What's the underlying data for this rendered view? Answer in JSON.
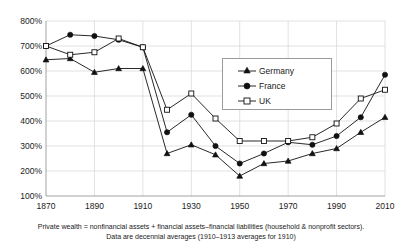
{
  "chart_data": {
    "type": "line",
    "title": "",
    "xlabel": "",
    "ylabel": "",
    "x": [
      1870,
      1880,
      1890,
      1900,
      1910,
      1920,
      1930,
      1940,
      1950,
      1960,
      1970,
      1980,
      1990,
      2000,
      2010
    ],
    "xlim": [
      1870,
      2010
    ],
    "ylim": [
      100,
      800
    ],
    "ytick_labels": [
      "100%",
      "200%",
      "300%",
      "400%",
      "500%",
      "600%",
      "700%",
      "800%"
    ],
    "ytick_values": [
      100,
      200,
      300,
      400,
      500,
      600,
      700,
      800
    ],
    "xtick_labels": [
      "1870",
      "1890",
      "1910",
      "1930",
      "1950",
      "1970",
      "1990",
      "2010"
    ],
    "xtick_values": [
      1870,
      1890,
      1910,
      1930,
      1950,
      1970,
      1990,
      2010
    ],
    "grid": true,
    "legend_position": "upper right inside",
    "series": [
      {
        "name": "Germany",
        "marker": "triangle-filled",
        "color": "#111111",
        "values": [
          645,
          650,
          595,
          610,
          610,
          270,
          305,
          265,
          180,
          230,
          240,
          270,
          290,
          355,
          415
        ]
      },
      {
        "name": "France",
        "marker": "circle-filled",
        "color": "#111111",
        "values": [
          700,
          745,
          740,
          725,
          695,
          355,
          425,
          300,
          230,
          270,
          315,
          305,
          340,
          415,
          585
        ]
      },
      {
        "name": "UK",
        "marker": "square-open",
        "color": "#111111",
        "values": [
          700,
          665,
          675,
          730,
          695,
          445,
          510,
          410,
          320,
          320,
          320,
          335,
          390,
          490,
          525
        ]
      }
    ],
    "annotations": [
      "Private wealth = nonfinancial assets + financial assets–financial liabilities (household & nonprofit sectors).",
      "Data are decennial averages (1910–1913 averages for 1910)"
    ]
  },
  "legend": {
    "items": [
      {
        "label": "Germany",
        "marker": "triangle-filled"
      },
      {
        "label": "France",
        "marker": "circle-filled"
      },
      {
        "label": "UK",
        "marker": "square-open"
      }
    ]
  },
  "footnotes": {
    "line1": "Private wealth = nonfinancial assets + financial assets–financial liabilities (household & nonprofit sectors).",
    "line2": "Data are decennial averages (1910–1913 averages for 1910)"
  },
  "axes": {
    "y_labels": [
      "800%",
      "700%",
      "600%",
      "500%",
      "400%",
      "300%",
      "200%",
      "100%"
    ],
    "x_labels": [
      "1870",
      "1890",
      "1910",
      "1930",
      "1950",
      "1970",
      "1990",
      "2010"
    ]
  },
  "colors": {
    "line": "#111111",
    "grid": "#d4d4d4",
    "axis": "#8a8a8a",
    "background": "#ffffff",
    "text": "#1a1a1a"
  }
}
